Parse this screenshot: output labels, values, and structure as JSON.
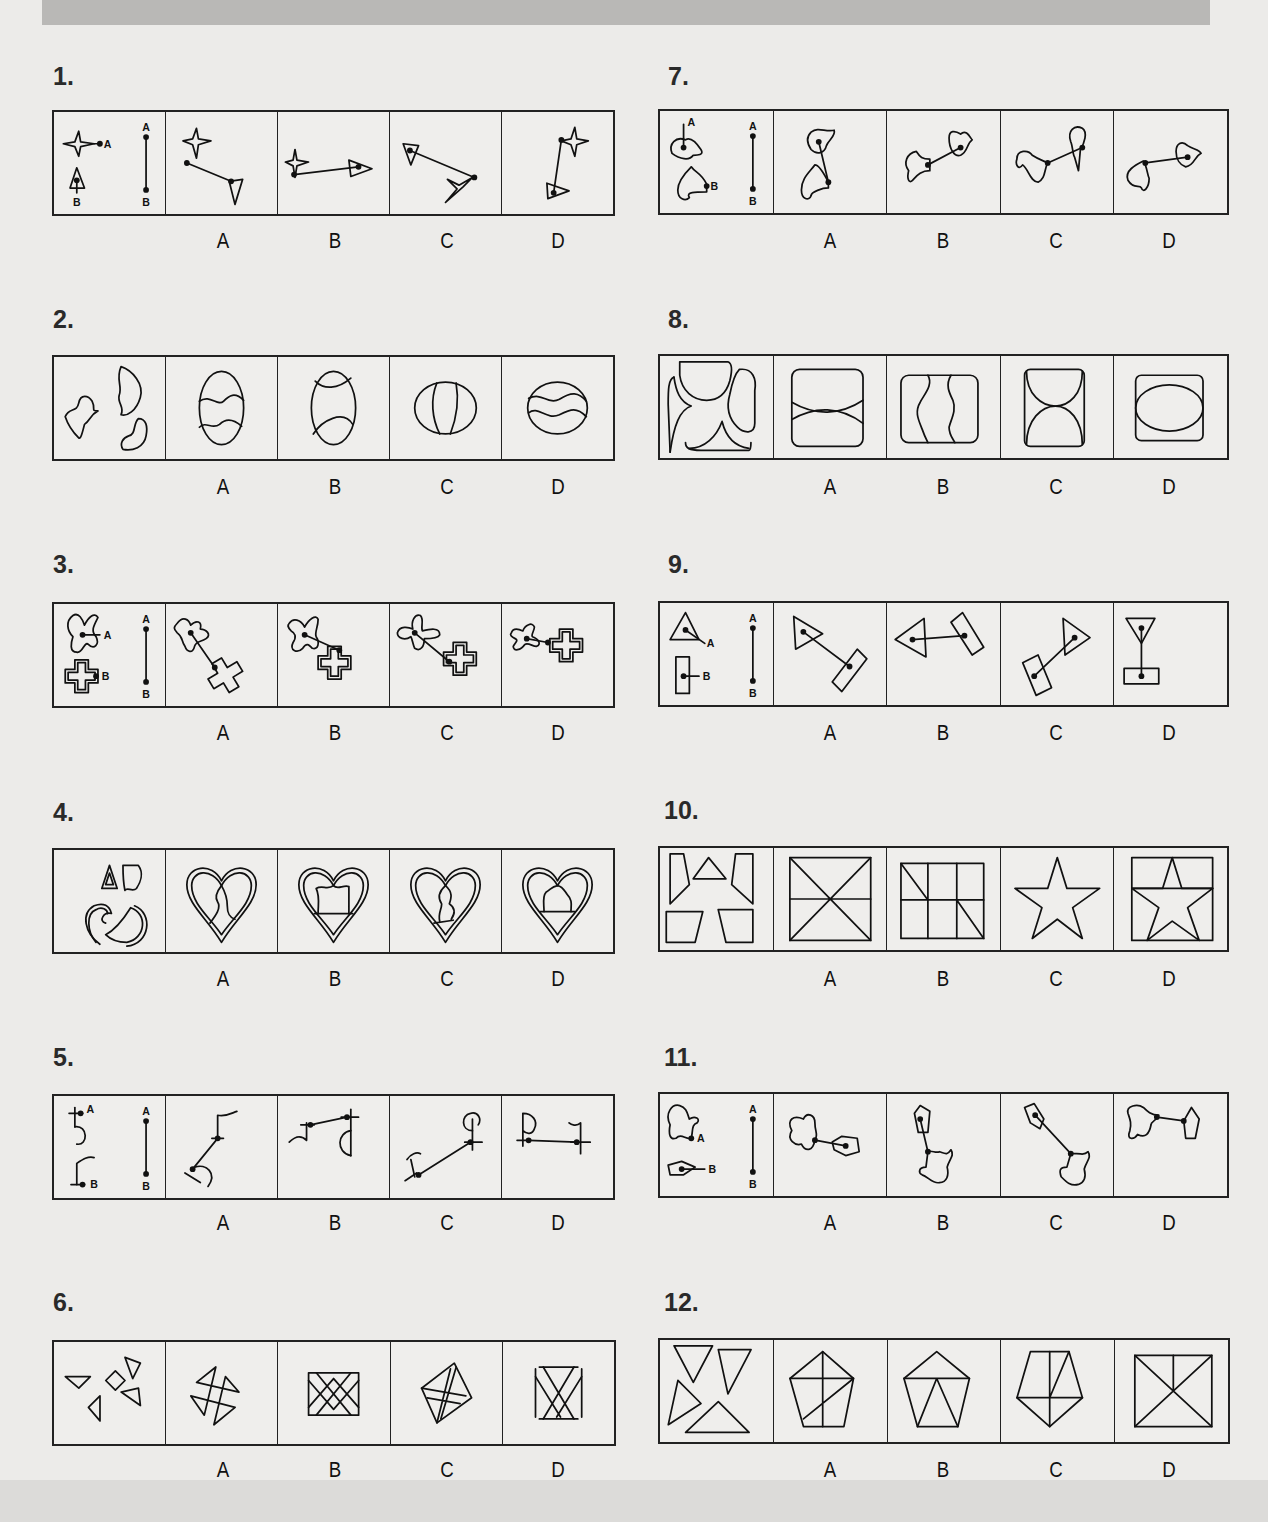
{
  "page": {
    "header_bar": "",
    "questions": [
      {
        "number": "1.",
        "given_label": "A–B connection",
        "options": [
          "A",
          "B",
          "C",
          "D"
        ],
        "shapes": "four-point star (A) and triangle (B) joined by line"
      },
      {
        "number": "2.",
        "given_label": "pieces",
        "options": [
          "A",
          "B",
          "C",
          "D"
        ],
        "shapes": "wavy pieces assembling into ovals"
      },
      {
        "number": "3.",
        "given_label": "A–B connection",
        "options": [
          "A",
          "B",
          "C",
          "D"
        ],
        "shapes": "X-blob (A) and double-outlined cross (B)"
      },
      {
        "number": "4.",
        "given_label": "pieces",
        "options": [
          "A",
          "B",
          "C",
          "D"
        ],
        "shapes": "double-outline heart pieces"
      },
      {
        "number": "5.",
        "given_label": "A–B connection",
        "options": [
          "A",
          "B",
          "C",
          "D"
        ],
        "shapes": "hook glyphs joined by line"
      },
      {
        "number": "6.",
        "given_label": "pieces",
        "options": [
          "A",
          "B",
          "C",
          "D"
        ],
        "shapes": "small triangles and diamond"
      },
      {
        "number": "7.",
        "given_label": "A–B connection",
        "options": [
          "A",
          "B",
          "C",
          "D"
        ],
        "shapes": "two irregular blobs"
      },
      {
        "number": "8.",
        "given_label": "pieces",
        "options": [
          "A",
          "B",
          "C",
          "D"
        ],
        "shapes": "curved pieces forming rounded squares"
      },
      {
        "number": "9.",
        "given_label": "A–B connection",
        "options": [
          "A",
          "B",
          "C",
          "D"
        ],
        "shapes": "triangle (A) and rectangle (B)"
      },
      {
        "number": "10.",
        "given_label": "pieces",
        "options": [
          "A",
          "B",
          "C",
          "D"
        ],
        "shapes": "polygons forming square/star"
      },
      {
        "number": "11.",
        "given_label": "A–B connection",
        "options": [
          "A",
          "B",
          "C",
          "D"
        ],
        "shapes": "blob (A) and pentagon (B)"
      },
      {
        "number": "12.",
        "given_label": "pieces",
        "options": [
          "A",
          "B",
          "C",
          "D"
        ],
        "shapes": "four triangles forming pentagon/rectangle"
      }
    ],
    "point_labels": {
      "a": "A",
      "b": "B"
    }
  }
}
